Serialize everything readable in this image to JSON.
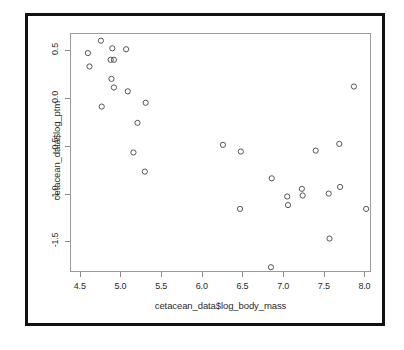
{
  "chart_data": {
    "type": "scatter",
    "title": "",
    "xlabel": "cetacean_data$log_body_mass",
    "ylabel": "cetacean_data$log_ptm",
    "xlim": [
      4.38,
      8.08
    ],
    "ylim": [
      -1.82,
      0.68
    ],
    "xticks": [
      "4.5",
      "5.0",
      "5.5",
      "6.0",
      "6.5",
      "7.0",
      "7.5",
      "8.0"
    ],
    "xtick_values": [
      4.5,
      5.0,
      5.5,
      6.0,
      6.5,
      7.0,
      7.5,
      8.0
    ],
    "yticks": [
      "0.5",
      "0.0",
      "-0.5",
      "-1.0",
      "-1.5"
    ],
    "ytick_values": [
      0.5,
      0.0,
      -0.5,
      -1.0,
      -1.5
    ],
    "grid": false,
    "legend": false,
    "marker": "open-circle",
    "marker_color": "#555555",
    "point_count": 33,
    "points": [
      {
        "x": 4.6,
        "y": 0.47
      },
      {
        "x": 4.62,
        "y": 0.33
      },
      {
        "x": 4.76,
        "y": 0.6
      },
      {
        "x": 4.77,
        "y": -0.09
      },
      {
        "x": 4.88,
        "y": 0.4
      },
      {
        "x": 4.9,
        "y": 0.52
      },
      {
        "x": 4.92,
        "y": 0.4
      },
      {
        "x": 4.89,
        "y": 0.2
      },
      {
        "x": 4.92,
        "y": 0.11
      },
      {
        "x": 5.07,
        "y": 0.51
      },
      {
        "x": 5.09,
        "y": 0.07
      },
      {
        "x": 5.21,
        "y": -0.26
      },
      {
        "x": 5.16,
        "y": -0.57
      },
      {
        "x": 5.31,
        "y": -0.05
      },
      {
        "x": 5.3,
        "y": -0.77
      },
      {
        "x": 6.26,
        "y": -0.49
      },
      {
        "x": 6.48,
        "y": -0.56
      },
      {
        "x": 6.47,
        "y": -1.16
      },
      {
        "x": 6.86,
        "y": -0.84
      },
      {
        "x": 6.85,
        "y": -1.77
      },
      {
        "x": 7.05,
        "y": -1.03
      },
      {
        "x": 7.06,
        "y": -1.12
      },
      {
        "x": 7.23,
        "y": -0.95
      },
      {
        "x": 7.24,
        "y": -1.02
      },
      {
        "x": 7.4,
        "y": -0.55
      },
      {
        "x": 7.56,
        "y": -1.0
      },
      {
        "x": 7.57,
        "y": -1.47
      },
      {
        "x": 7.69,
        "y": -0.48
      },
      {
        "x": 7.7,
        "y": -0.93
      },
      {
        "x": 7.87,
        "y": 0.12
      },
      {
        "x": 8.02,
        "y": -1.16
      }
    ],
    "colors": {
      "point_stroke": "#555555",
      "panel_border": "#9a9a9a",
      "outer_border": "#111111",
      "axis_text": "#2b2b2b",
      "background": "#ffffff"
    }
  }
}
